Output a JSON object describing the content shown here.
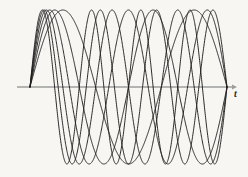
{
  "figure": {
    "title": "",
    "axis_label_t": "t",
    "background_color": "#f7f6f3",
    "curve_color": "#1f1f1f",
    "axis_color": "#9d9d9b"
  },
  "chart_data": {
    "type": "line",
    "title": "",
    "subtitle": "",
    "xlabel": "t",
    "ylabel": "",
    "legend": [],
    "legend_position": "none",
    "grid": false,
    "xlim": [
      0,
      1
    ],
    "ylim": [
      -1.15,
      1.15
    ],
    "axis": {
      "x_axis_y_value": 0,
      "x_axis_pixel_y": 87,
      "x_axis_pixel_start": 17,
      "x_axis_pixel_end": 232,
      "arrow_at_right": true,
      "y_axis_drawn": false,
      "ticks": [],
      "tick_labels": []
    },
    "common_origin_x": 0.06,
    "node_x": 0.5175,
    "series": [
      {
        "name": "harmonic-1",
        "frequency_half_cycles": 3,
        "amplitude": 1.0,
        "phase": 0
      },
      {
        "name": "harmonic-2",
        "frequency_half_cycles": 4,
        "amplitude": 1.0,
        "phase": 0
      },
      {
        "name": "harmonic-3",
        "frequency_half_cycles": 5,
        "amplitude": 1.0,
        "phase": 0
      },
      {
        "name": "harmonic-4",
        "frequency_half_cycles": 6,
        "amplitude": 1.0,
        "phase": 0
      },
      {
        "name": "harmonic-5",
        "frequency_half_cycles": 7,
        "amplitude": 1.0,
        "phase": 0
      },
      {
        "name": "harmonic-6",
        "frequency_half_cycles": 8,
        "amplitude": 1.0,
        "phase": 0
      }
    ]
  }
}
